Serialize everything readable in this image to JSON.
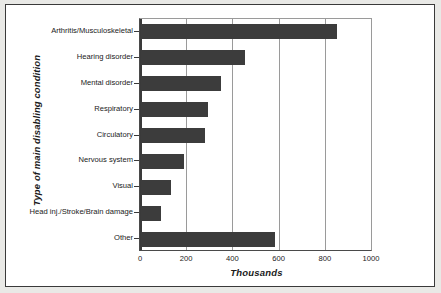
{
  "chart_data": {
    "type": "bar",
    "orientation": "horizontal",
    "title": "",
    "xlabel": "Thousands",
    "ylabel": "Type of main disabling condition",
    "xlim": [
      0,
      1000
    ],
    "xticks": [
      "0",
      "200",
      "400",
      "600",
      "800",
      "1000"
    ],
    "xtick_values": [
      0,
      200,
      400,
      600,
      800,
      1000
    ],
    "grid": "vertical",
    "legend": "none",
    "bar_color": "#3c3c3c",
    "categories": [
      "Arthritis/Musculoskeletal",
      "Hearing disorder",
      "Mental disorder",
      "Respiratory",
      "Circulatory",
      "Nervous system",
      "Visual",
      "Head inj./Stroke/Brain damage",
      "Other"
    ],
    "values": [
      850,
      450,
      345,
      290,
      275,
      185,
      128,
      88,
      580
    ]
  }
}
